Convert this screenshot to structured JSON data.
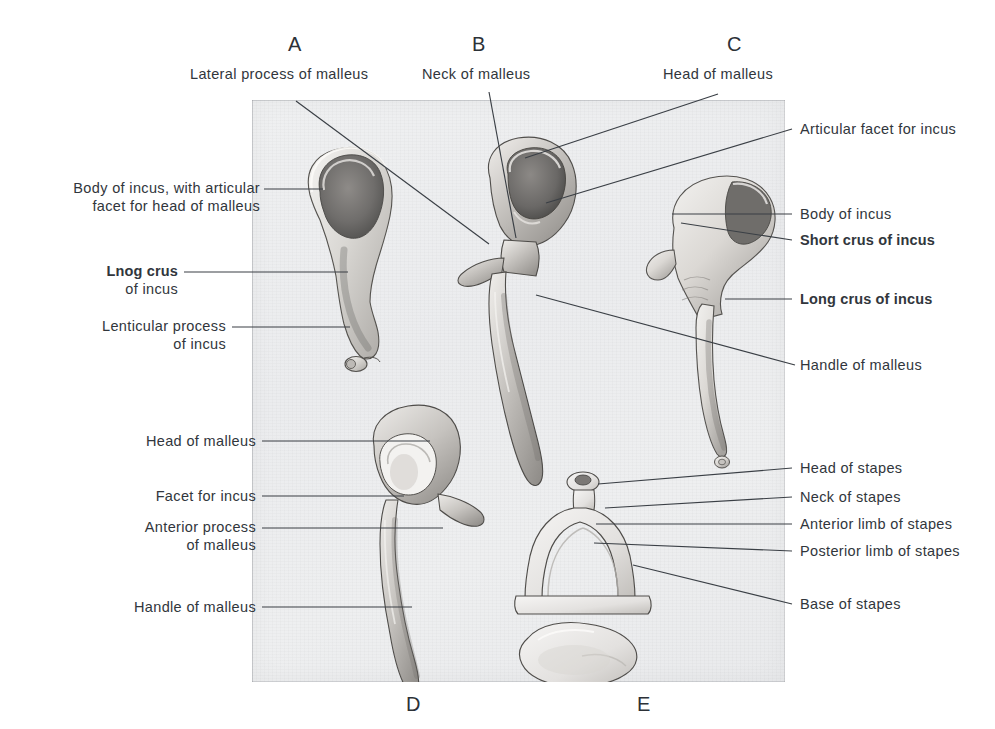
{
  "figure": {
    "plate_background": "#edeef0",
    "ink_color": "#31363c"
  },
  "panel_letters": [
    {
      "id": "A",
      "text": "A",
      "x": 288,
      "y": 34
    },
    {
      "id": "B",
      "text": "B",
      "x": 472,
      "y": 34
    },
    {
      "id": "C",
      "text": "C",
      "x": 727,
      "y": 34
    },
    {
      "id": "D",
      "text": "D",
      "x": 406,
      "y": 694
    },
    {
      "id": "E",
      "text": "E",
      "x": 637,
      "y": 694
    }
  ],
  "labels": {
    "top": [
      {
        "id": "lateral-process-of-malleus",
        "text": "Lateral process of malleus",
        "bold": false
      },
      {
        "id": "neck-of-malleus",
        "text": "Neck of malleus",
        "bold": false
      },
      {
        "id": "head-of-malleus-top",
        "text": "Head of malleus",
        "bold": false
      }
    ],
    "left_upper": [
      {
        "id": "body-of-incus-with-articular-facet",
        "line1": "Body of incus, with articular",
        "line2": "facet for head of malleus",
        "bold": false
      },
      {
        "id": "lnog-crus-of-incus",
        "line1": "Lnog crus",
        "line2": "of incus",
        "bold": true
      },
      {
        "id": "lenticular-process-of-incus",
        "line1": "Lenticular process",
        "line2": "of incus",
        "bold": false
      }
    ],
    "right_upper": [
      {
        "id": "articular-facet-for-incus",
        "text": "Articular facet for incus",
        "bold": false
      },
      {
        "id": "body-of-incus",
        "text": "Body of incus",
        "bold": false
      },
      {
        "id": "short-crus-of-incus",
        "text": "Short crus of incus",
        "bold": true
      },
      {
        "id": "long-crus-of-incus",
        "text": "Long crus of incus",
        "bold": true
      },
      {
        "id": "handle-of-malleus-right",
        "text": "Handle of malleus",
        "bold": false
      }
    ],
    "left_lower": [
      {
        "id": "head-of-malleus-left",
        "line1": "Head of malleus",
        "line2": "",
        "bold": false
      },
      {
        "id": "facet-for-incus",
        "line1": "Facet for incus",
        "line2": "",
        "bold": false
      },
      {
        "id": "anterior-process-of-malleus",
        "line1": "Anterior process",
        "line2": "of malleus",
        "bold": false
      },
      {
        "id": "handle-of-malleus-left",
        "line1": "Handle of malleus",
        "line2": "",
        "bold": false
      }
    ],
    "right_lower": [
      {
        "id": "head-of-stapes",
        "text": "Head of stapes",
        "bold": false
      },
      {
        "id": "neck-of-stapes",
        "text": "Neck of stapes",
        "bold": false
      },
      {
        "id": "anterior-limb-of-stapes",
        "text": "Anterior limb of stapes",
        "bold": false
      },
      {
        "id": "posterior-limb-of-stapes",
        "text": "Posterior limb of stapes",
        "bold": false
      },
      {
        "id": "base-of-stapes",
        "text": "Base of stapes",
        "bold": false
      }
    ]
  },
  "specimens": [
    {
      "id": "A",
      "name": "incus-medial-view"
    },
    {
      "id": "B",
      "name": "malleus-posterior-view"
    },
    {
      "id": "C",
      "name": "incus-anterior-view"
    },
    {
      "id": "D",
      "name": "malleus-anterior-view"
    },
    {
      "id": "E",
      "name": "stapes-with-base"
    }
  ]
}
